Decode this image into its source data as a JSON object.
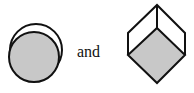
{
  "diagram": {
    "conjunction": "and",
    "left_figure": "overlapping circles: shaded circle in front of outline circle",
    "right_figure": "hexagon/cube outline with shaded lower rhombus face",
    "colors": {
      "stroke": "#111111",
      "fill": "#c8c8c8",
      "background": "#ffffff"
    }
  }
}
